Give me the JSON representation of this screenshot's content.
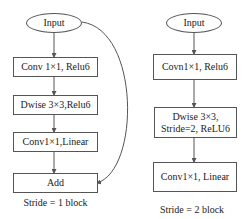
{
  "left_block": {
    "input": "Input",
    "conv1": "Conv 1×1,  Relu6",
    "dwise": "Dwise 3×3,Relu6",
    "conv2": "Conv1×1,Linear",
    "add": "Add",
    "caption": "Stride = 1 block"
  },
  "right_block": {
    "input": "Input",
    "conv1": "Covn1×1,  Relu6",
    "dwise_line1": "Dwise 3×3,",
    "dwise_line2": "Stride=2, ReLU6",
    "conv2": "Conv1×1,  Linear",
    "caption": "Stride = 2 block"
  },
  "colors": {
    "line": "#555555",
    "background": "#ffffff"
  }
}
